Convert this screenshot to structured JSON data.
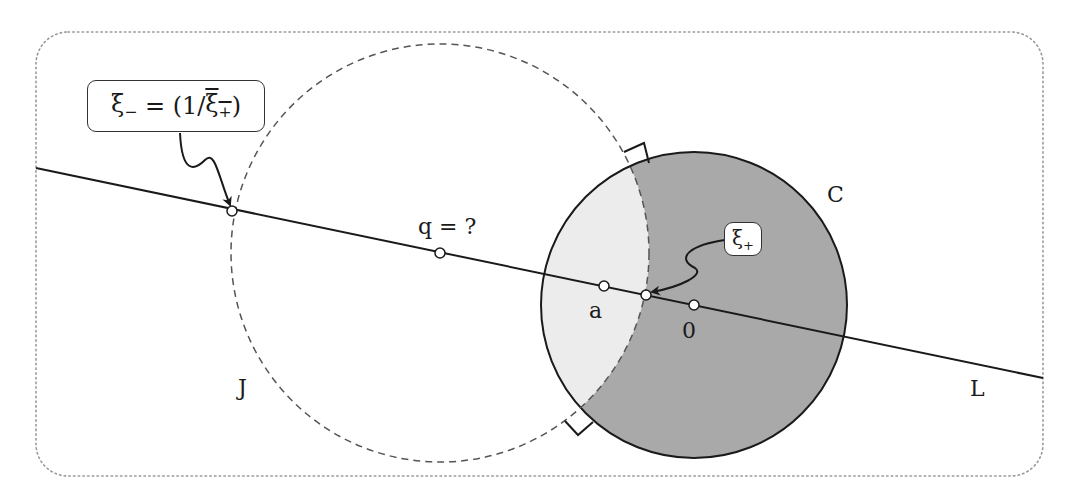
{
  "figure": {
    "frame": {
      "style": "dotted rounded rectangle",
      "color": "#9a9a9a"
    },
    "line_L": {
      "label": "L",
      "from": [
        36,
        168
      ],
      "to": [
        1043,
        378
      ]
    },
    "circle_C": {
      "label": "C",
      "center": [
        694,
        305
      ],
      "radius": 153,
      "fill": "#a9a9a9",
      "stroke": "#1a1a1a"
    },
    "circle_J": {
      "label": "J",
      "center": [
        440,
        253
      ],
      "radius": 209,
      "style": "dashed",
      "stroke": "#555555"
    },
    "lens_fill": "#ececec",
    "points": [
      {
        "id": "xi_minus",
        "pos": [
          232,
          211
        ]
      },
      {
        "id": "q",
        "label": "q = ?",
        "pos": [
          440,
          253
        ]
      },
      {
        "id": "a",
        "label": "a",
        "pos": [
          604,
          286
        ]
      },
      {
        "id": "xi_plus",
        "pos": [
          646,
          295
        ]
      },
      {
        "id": "origin",
        "label": "0",
        "pos": [
          694,
          305
        ]
      }
    ],
    "callouts": {
      "xi_minus": {
        "base": "ξ",
        "sub": "−",
        "eq": " = (1/",
        "bar_base": "ξ",
        "bar_sub": "+",
        "close": ")"
      },
      "xi_plus": {
        "base": "ξ",
        "sub": "+"
      }
    },
    "labels": {
      "C": "C",
      "J": "J",
      "L": "L",
      "q": "q = ?",
      "a": "a",
      "zero": "0"
    }
  }
}
